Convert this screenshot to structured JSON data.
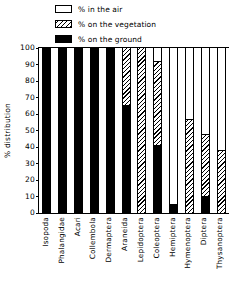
{
  "legend": {
    "items": [
      {
        "label": "% in the air",
        "swatch": "air",
        "icon": "empty-box-icon"
      },
      {
        "label": "% on the vegetation",
        "swatch": "veg",
        "icon": "hatched-box-icon"
      },
      {
        "label": "% on the ground",
        "swatch": "ground",
        "icon": "filled-box-icon"
      }
    ]
  },
  "axes": {
    "ylabel": "% distribution",
    "yticks": [
      "100",
      "90",
      "80",
      "70",
      "60",
      "50",
      "40",
      "30",
      "20",
      "10",
      "0"
    ]
  },
  "colors": {
    "ink": "#000000",
    "paper": "#ffffff"
  },
  "chart_data": {
    "type": "bar",
    "title": "",
    "xlabel": "",
    "ylabel": "% distribution",
    "ylim": [
      0,
      100
    ],
    "ytick_step": 10,
    "grid": false,
    "legend_position": "top",
    "stacked": true,
    "stack_order_bottom_to_top": [
      "% on the ground",
      "% on the vegetation",
      "% in the air"
    ],
    "categories": [
      "Isopoda",
      "Phalangidae",
      "Acari",
      "Collembola",
      "Dermaptera",
      "Araneida",
      "Lepidoptera",
      "Coleoptera",
      "Hemiptera",
      "Hymenoptera",
      "Diptera",
      "Thysanoptera"
    ],
    "series": [
      {
        "name": "% on the ground",
        "values": [
          100,
          100,
          100,
          100,
          100,
          65,
          0,
          41,
          5,
          0,
          10,
          0
        ]
      },
      {
        "name": "% on the vegetation",
        "values": [
          0,
          0,
          0,
          0,
          0,
          35,
          100,
          51,
          0,
          57,
          37,
          38
        ]
      },
      {
        "name": "% in the air",
        "values": [
          0,
          0,
          0,
          0,
          0,
          0,
          0,
          8,
          95,
          43,
          53,
          62
        ]
      }
    ]
  }
}
